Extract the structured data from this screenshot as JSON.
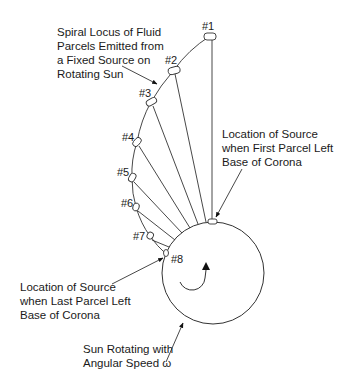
{
  "annotations": {
    "spiral": [
      "Spiral Locus of Fluid",
      "Parcels Emitted from",
      "a Fixed Source on",
      "Rotating Sun"
    ],
    "first_source": [
      "Location of Source",
      "when First Parcel Left",
      "Base of Corona"
    ],
    "last_source": [
      "Location of Source",
      "when Last Parcel Left",
      "Base of Corona"
    ],
    "sun": [
      "Sun Rotating with",
      "Angular Speed ω"
    ]
  },
  "parcels": [
    {
      "label": "#1",
      "x": 210,
      "y": 36
    },
    {
      "label": "#2",
      "x": 174,
      "y": 70
    },
    {
      "label": "#3",
      "x": 151,
      "y": 102
    },
    {
      "label": "#4",
      "x": 137,
      "y": 142
    },
    {
      "label": "#5",
      "x": 132,
      "y": 178
    },
    {
      "label": "#6",
      "x": 136,
      "y": 207
    },
    {
      "label": "#7",
      "x": 150,
      "y": 236
    },
    {
      "label": "#8",
      "x": 166,
      "y": 253
    }
  ],
  "sun": {
    "cx": 213,
    "cy": 273,
    "r": 51
  },
  "colors": {
    "line": "#333333",
    "text": "#1a1a1a",
    "background": "#ffffff"
  }
}
